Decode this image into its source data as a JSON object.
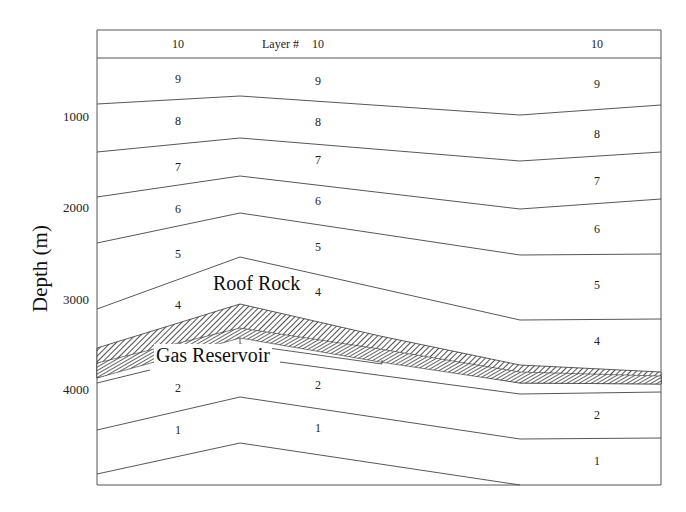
{
  "figure": {
    "axis": {
      "y_title": "Depth (m)",
      "ticks": [
        {
          "label": "1000",
          "y": 117
        },
        {
          "label": "2000",
          "y": 208
        },
        {
          "label": "3000",
          "y": 300
        },
        {
          "label": "4000",
          "y": 390
        }
      ]
    },
    "header": {
      "layer_label": "Layer #"
    },
    "annotations": {
      "roof_rock": "Roof Rock",
      "gas_reservoir": "Gas Reservoir"
    },
    "layer_labels": [
      {
        "text": "10",
        "x": 178,
        "y": 44
      },
      {
        "text": "10",
        "x": 318,
        "y": 44
      },
      {
        "text": "10",
        "x": 597,
        "y": 44
      },
      {
        "text": "9",
        "x": 178,
        "y": 79
      },
      {
        "text": "9",
        "x": 318,
        "y": 81
      },
      {
        "text": "9",
        "x": 597,
        "y": 84
      },
      {
        "text": "8",
        "x": 178,
        "y": 121
      },
      {
        "text": "8",
        "x": 318,
        "y": 122
      },
      {
        "text": "8",
        "x": 597,
        "y": 134
      },
      {
        "text": "7",
        "x": 178,
        "y": 167
      },
      {
        "text": "7",
        "x": 318,
        "y": 160
      },
      {
        "text": "7",
        "x": 597,
        "y": 181
      },
      {
        "text": "6",
        "x": 178,
        "y": 209
      },
      {
        "text": "6",
        "x": 318,
        "y": 201
      },
      {
        "text": "6",
        "x": 597,
        "y": 229
      },
      {
        "text": "5",
        "x": 178,
        "y": 254
      },
      {
        "text": "5",
        "x": 318,
        "y": 247
      },
      {
        "text": "5",
        "x": 597,
        "y": 285
      },
      {
        "text": "4",
        "x": 178,
        "y": 305
      },
      {
        "text": "4",
        "x": 318,
        "y": 292
      },
      {
        "text": "4",
        "x": 597,
        "y": 341
      },
      {
        "text": "2",
        "x": 178,
        "y": 388
      },
      {
        "text": "2",
        "x": 318,
        "y": 385
      },
      {
        "text": "2",
        "x": 597,
        "y": 415
      },
      {
        "text": "1",
        "x": 178,
        "y": 430
      },
      {
        "text": "1",
        "x": 318,
        "y": 428
      },
      {
        "text": "1",
        "x": 597,
        "y": 461
      }
    ]
  }
}
